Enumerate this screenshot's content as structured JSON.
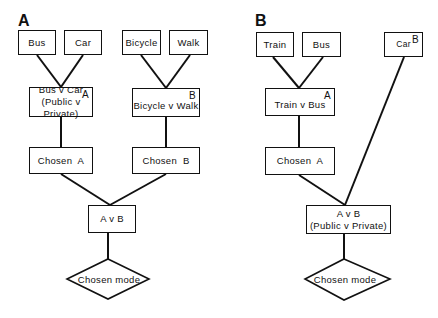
{
  "panels": [
    {
      "label": "A",
      "top_options": [
        "Bus",
        "Car",
        "Bicycle",
        "Walk"
      ],
      "nest_a": {
        "line1": "Bus v Car",
        "line2": "(Public v Private)",
        "tag": "A"
      },
      "nest_b": {
        "line1": "Bicycle v Walk",
        "tag": "B"
      },
      "chosen_a": "Chosen  A",
      "chosen_b": "Chosen  B",
      "top_choice": {
        "line1": "A v B"
      },
      "result": "Chosen mode"
    },
    {
      "label": "B",
      "top_options": [
        "Train",
        "Bus",
        "Car"
      ],
      "car_tag": "B",
      "nest_a": {
        "line1": "Train v Bus",
        "tag": "A"
      },
      "chosen_a": "Chosen  A",
      "top_choice": {
        "line1": "A v B",
        "line2": "(Public v Private)"
      },
      "result": "Chosen mode"
    }
  ]
}
